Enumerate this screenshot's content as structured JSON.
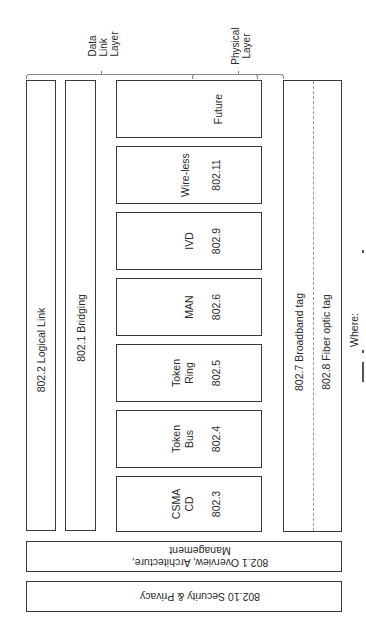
{
  "diagram": {
    "type": "IEEE 802 standards layer diagram (rotated 90°)",
    "layer_labels": {
      "data_link": [
        "Data",
        "Link",
        "Layer"
      ],
      "physical": [
        "Physical",
        "Layer"
      ]
    },
    "long_bars": {
      "logical_link": "802.2 Logical Link",
      "bridging": "802.1 Bridging"
    },
    "mac_boxes": [
      {
        "name": "Future",
        "number": ""
      },
      {
        "name": "Wire-less",
        "number": "802.11"
      },
      {
        "name": "IVD",
        "number": "802.9"
      },
      {
        "name": "MAN",
        "number": "802.6"
      },
      {
        "name": "Token\nRing",
        "number": "802.5"
      },
      {
        "name": "Token\nBus",
        "number": "802.4"
      },
      {
        "name": "CSMA\nCD",
        "number": "802.3"
      }
    ],
    "tags": {
      "broadband": "802.7 Broadband tag",
      "fiber": "802.8 Fiber optic tag"
    },
    "bottom_bars": {
      "overview_line1": "802.1 Overview, Architecture,",
      "overview_line2": "Management",
      "security": "802.10 Security & Privacy"
    },
    "footnote": "Where:"
  }
}
